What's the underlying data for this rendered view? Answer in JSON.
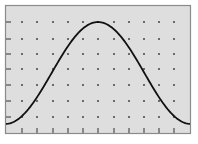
{
  "colors": {
    "page_background": "#ffffff",
    "plot_background": "#dedede",
    "frame": "#8a8a8a",
    "tick": "#333333",
    "grid_dot": "#2a2a2a",
    "curve": "#111111"
  },
  "chart_data": {
    "type": "line",
    "title": "",
    "xlabel": "",
    "ylabel": "",
    "x_ticks": [
      0,
      1,
      2,
      3,
      4,
      5,
      6,
      7,
      8,
      9,
      10
    ],
    "y_ticks": [
      0,
      1,
      2,
      3,
      4,
      5,
      6
    ],
    "x_tick_labels": [],
    "y_tick_labels": [],
    "xlim": [
      -1.1,
      11.1
    ],
    "ylim": [
      -0.5,
      7.1
    ],
    "grid": "dots",
    "legend": null,
    "series": [
      {
        "name": "curve",
        "shape": "bell (raised cosine)",
        "x": [
          -1.1,
          0,
          1,
          2,
          3,
          4,
          5,
          6,
          7,
          8,
          9,
          10,
          11.1
        ],
        "y": [
          -0.44,
          0.1,
          0.85,
          2.85,
          4.4,
          5.6,
          6.0,
          5.6,
          4.4,
          2.85,
          0.85,
          0.1,
          -0.44
        ]
      }
    ]
  },
  "layout": {
    "frame": {
      "left": 5,
      "top": 5,
      "right": 191,
      "bottom": 134
    },
    "x_tick_px": [
      22,
      37,
      53,
      68,
      83,
      98,
      114,
      129,
      144,
      159,
      174
    ],
    "y_tick_px": [
      117,
      101,
      85,
      69,
      54,
      39,
      22
    ]
  }
}
